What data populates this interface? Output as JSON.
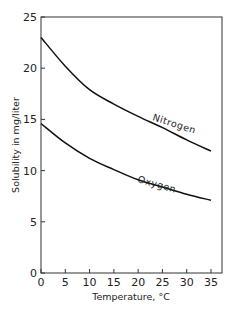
{
  "chart_data": {
    "type": "line",
    "title": "",
    "xlabel": "Temperature, °C",
    "ylabel": "Solubility in mg/liter",
    "xlim": [
      0,
      35
    ],
    "ylim": [
      0,
      25
    ],
    "xticks": [
      0,
      5,
      10,
      15,
      20,
      25,
      30,
      35
    ],
    "yticks": [
      0,
      5,
      10,
      15,
      20,
      25
    ],
    "grid": false,
    "legend": "inline labels on curves",
    "x": [
      0,
      5,
      10,
      15,
      20,
      25,
      30,
      35
    ],
    "series": [
      {
        "name": "Nitrogen",
        "values": [
          23.0,
          20.2,
          17.9,
          16.5,
          15.3,
          14.2,
          13.0,
          11.9
        ],
        "color": "#111111"
      },
      {
        "name": "Oxygen",
        "values": [
          14.6,
          12.7,
          11.2,
          10.1,
          9.1,
          8.4,
          7.7,
          7.1
        ],
        "color": "#111111"
      }
    ]
  }
}
